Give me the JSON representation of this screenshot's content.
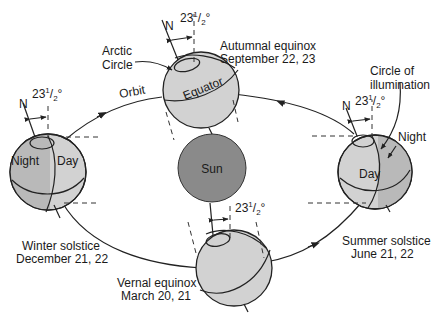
{
  "diagram": {
    "colors": {
      "background": "#ffffff",
      "earth_day": "#d2d2d2",
      "earth_night": "#b9b9b9",
      "sun": "#8a8a8a",
      "lines": "#222222"
    },
    "sun": {
      "label": "Sun"
    },
    "orbit": {
      "label": "Orbit"
    },
    "tilt": {
      "whole": "23",
      "num": "1",
      "den": "2",
      "deg": "°"
    },
    "north_label": "N",
    "positions": {
      "autumnal": {
        "name": "Autumnal equinox",
        "date": "September 22, 23"
      },
      "winter": {
        "name": "Winter solstice",
        "date": "December 21, 22"
      },
      "vernal": {
        "name": "Vernal equinox",
        "date": "March 20, 21"
      },
      "summer": {
        "name": "Summer solstice",
        "date": "June 21, 22"
      }
    },
    "callouts": {
      "arctic_1": "Arctic",
      "arctic_2": "Circle",
      "equator": "Equator",
      "circle_1": "Circle of",
      "circle_2": "illumination",
      "night": "Night",
      "day": "Day"
    }
  }
}
